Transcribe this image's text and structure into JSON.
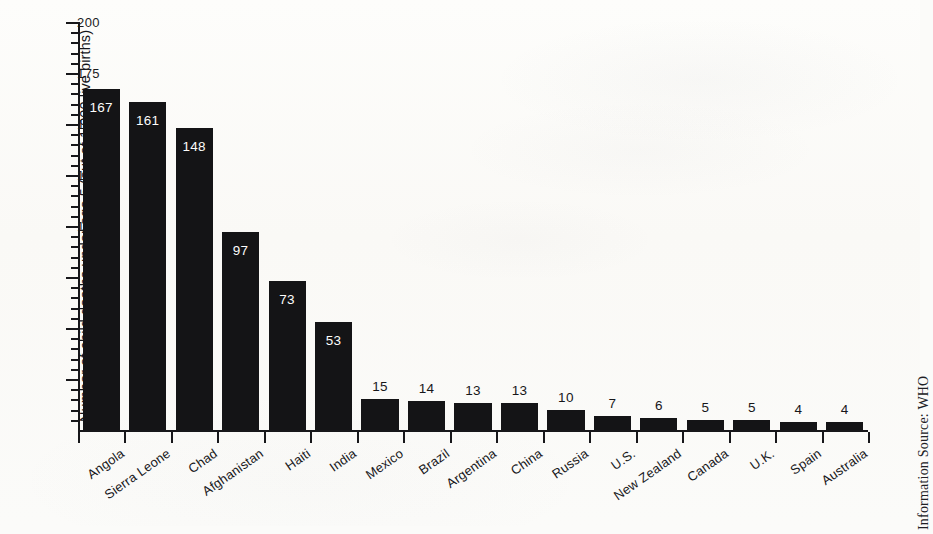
{
  "chart_data": {
    "type": "bar",
    "title": "",
    "xlabel": "",
    "ylabel": "Number of child deaths under age 5 (out of 1,000 live births)",
    "ylim": [
      0,
      200
    ],
    "ytick_major_step": 25,
    "ytick_minor_step": 5,
    "ytick_labels": [
      "200",
      "175",
      "150",
      "125",
      "100",
      "75",
      "50",
      "25"
    ],
    "ytick_values": [
      200,
      175,
      150,
      125,
      100,
      75,
      50,
      25
    ],
    "grid": false,
    "legend": null,
    "bar_color": "#141416",
    "categories": [
      "Angola",
      "Sierra Leone",
      "Chad",
      "Afghanistan",
      "Haiti",
      "India",
      "Mexico",
      "Brazil",
      "Argentina",
      "China",
      "Russia",
      "U.S.",
      "New Zealand",
      "Canada",
      "U.K.",
      "Spain",
      "Australia"
    ],
    "values": [
      167,
      161,
      148,
      97,
      73,
      53,
      15,
      14,
      13,
      13,
      10,
      7,
      6,
      5,
      5,
      4,
      4
    ],
    "value_label_position": [
      "inside",
      "inside",
      "inside",
      "inside",
      "inside",
      "inside",
      "outside",
      "outside",
      "outside",
      "outside",
      "outside",
      "outside",
      "outside",
      "outside",
      "outside",
      "outside",
      "outside"
    ],
    "annotations": [
      "Information Source: WHO"
    ]
  },
  "source": {
    "text": "Information Source: WHO"
  }
}
